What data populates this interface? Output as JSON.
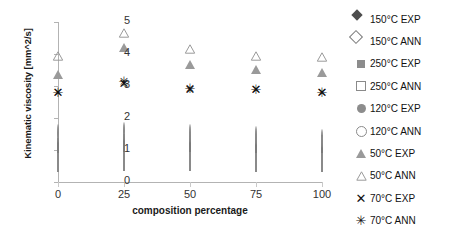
{
  "chart_data": {
    "type": "scatter",
    "title": "",
    "xlabel": "composition percentage",
    "ylabel": "Kinematic viscosity [mm^2/s]",
    "categories": [
      0,
      25,
      50,
      75,
      100
    ],
    "x": [
      0,
      25,
      50,
      75,
      100
    ],
    "xlim": [
      0,
      100
    ],
    "ylim": [
      0,
      5
    ],
    "yticks": [
      0,
      1,
      2,
      3,
      4,
      5
    ],
    "xticks": [
      0,
      25,
      50,
      75,
      100
    ],
    "grid": false,
    "legend_position": "right",
    "series": [
      {
        "name": "150°C EXP",
        "marker": "diamond-filled",
        "color": "#4d4d4d",
        "values": [
          1.05,
          1.2,
          1.2,
          1.2,
          1.15
        ]
      },
      {
        "name": "150°C ANN",
        "marker": "diamond-open",
        "color": "#7a7a7a",
        "values": [
          1.05,
          1.2,
          1.2,
          1.2,
          1.15
        ]
      },
      {
        "name": "250°C EXP",
        "marker": "square-filled",
        "color": "#8c8c8c",
        "values": [
          0.6,
          0.62,
          0.62,
          0.6,
          0.6
        ]
      },
      {
        "name": "250°C ANN",
        "marker": "square-open",
        "color": "#8a8a8a",
        "values": [
          0.6,
          0.62,
          0.62,
          0.6,
          0.6
        ]
      },
      {
        "name": "120°C EXP",
        "marker": "circle-filled",
        "color": "#8c8c8c",
        "values": [
          1.5,
          1.55,
          1.5,
          1.45,
          1.5
        ]
      },
      {
        "name": "120°C ANN",
        "marker": "circle-open",
        "color": "#8a8a8a",
        "values": [
          1.5,
          1.55,
          1.5,
          1.45,
          1.35
        ]
      },
      {
        "name": "50°C EXP",
        "marker": "triangle-filled",
        "color": "#9a9a9a",
        "values": [
          3.75,
          4.6,
          4.05,
          3.9,
          3.8
        ]
      },
      {
        "name": "50°C ANN",
        "marker": "triangle-open",
        "color": "#9a9a9a",
        "values": [
          3.95,
          4.65,
          4.15,
          3.95,
          3.9
        ]
      },
      {
        "name": "70°C EXP",
        "marker": "x",
        "color": "#111111",
        "values": [
          2.8,
          3.1,
          2.9,
          2.9,
          2.8
        ]
      },
      {
        "name": "70°C ANN",
        "marker": "star",
        "color": "#111111",
        "values": [
          2.8,
          3.15,
          2.95,
          2.9,
          2.8
        ]
      }
    ]
  },
  "axes": {
    "ylabel": "Kinematic viscosity [mm^2/s]",
    "xlabel": "composition percentage",
    "ytick_labels": [
      "0",
      "1",
      "2",
      "3",
      "4",
      "5"
    ],
    "xtick_labels": [
      "0",
      "25",
      "50",
      "75",
      "100"
    ]
  },
  "legend": {
    "items": [
      {
        "label": "150°C EXP",
        "marker": "diamond-filled"
      },
      {
        "label": "150°C ANN",
        "marker": "diamond-open"
      },
      {
        "label": "250°C EXP",
        "marker": "square-filled"
      },
      {
        "label": "250°C ANN",
        "marker": "square-open"
      },
      {
        "label": "120°C EXP",
        "marker": "circle-filled"
      },
      {
        "label": "120°C ANN",
        "marker": "circle-open"
      },
      {
        "label": "50°C EXP",
        "marker": "triangle-filled"
      },
      {
        "label": "50°C ANN",
        "marker": "triangle-open"
      },
      {
        "label": "70°C EXP",
        "marker": "x"
      },
      {
        "label": "70°C ANN",
        "marker": "star"
      }
    ]
  },
  "colors": {
    "dark": "#4d4d4d",
    "mid": "#8c8c8c",
    "light": "#9a9a9a",
    "black": "#111111",
    "axis": "#b3b3b3"
  }
}
